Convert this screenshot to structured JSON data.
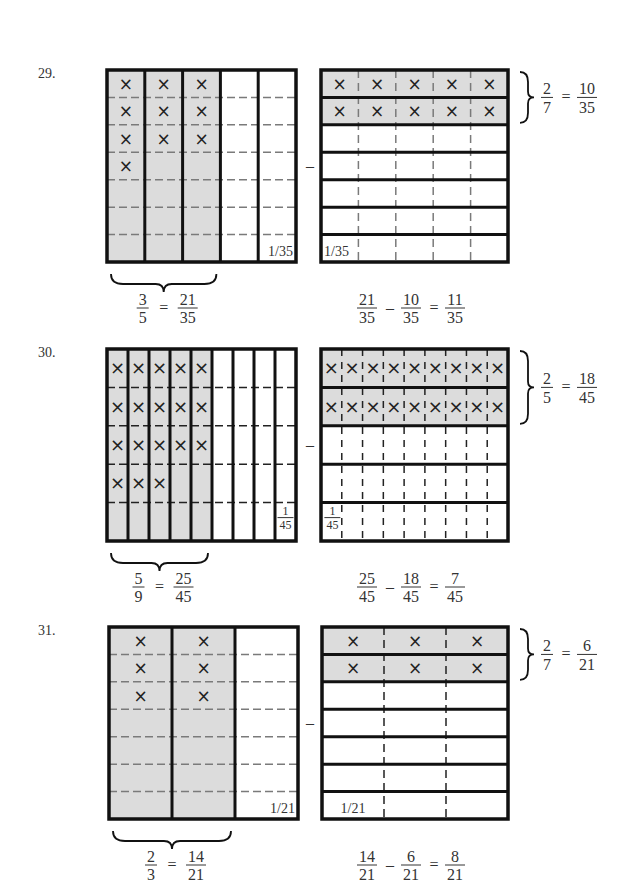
{
  "problems": [
    {
      "number": "29.",
      "top": 70,
      "bottom": 262,
      "left_grid": {
        "x": 107,
        "w": 189,
        "cols": 5,
        "shaded_cols": 3,
        "rows": 7,
        "x_counts_per_col": [
          4,
          3,
          3
        ],
        "unit_label": "1/35",
        "unit_label_type": "inline"
      },
      "right_grid": {
        "x": 321,
        "w": 187,
        "rows": 7,
        "shaded_rows": 2,
        "cols": 5,
        "unit_label": "1/35",
        "unit_label_type": "inline"
      },
      "minus": "–",
      "left_eq": {
        "a_num": "3",
        "a_den": "5",
        "eq": "=",
        "b_num": "21",
        "b_den": "35"
      },
      "right_brace_eq": {
        "a_num": "2",
        "a_den": "7",
        "eq": "=",
        "b_num": "10",
        "b_den": "35"
      },
      "result_eq": {
        "a_num": "21",
        "a_den": "35",
        "op": "–",
        "b_num": "10",
        "b_den": "35",
        "eq": "=",
        "c_num": "11",
        "c_den": "35"
      }
    },
    {
      "number": "30.",
      "top": 349,
      "bottom": 541,
      "left_grid": {
        "x": 107,
        "w": 189,
        "cols": 9,
        "shaded_cols": 5,
        "rows": 5,
        "x_counts_per_col": [
          4,
          4,
          4,
          3,
          3
        ],
        "unit_label": "1/45",
        "unit_label_type": "stacked"
      },
      "right_grid": {
        "x": 321,
        "w": 187,
        "rows": 5,
        "shaded_rows": 2,
        "cols": 9,
        "unit_label": "1/45",
        "unit_label_type": "stacked"
      },
      "minus": "–",
      "left_eq": {
        "a_num": "5",
        "a_den": "9",
        "eq": "=",
        "b_num": "25",
        "b_den": "45"
      },
      "right_brace_eq": {
        "a_num": "2",
        "a_den": "5",
        "eq": "=",
        "b_num": "18",
        "b_den": "45"
      },
      "result_eq": {
        "a_num": "25",
        "a_den": "45",
        "op": "–",
        "b_num": "18",
        "b_den": "45",
        "eq": "=",
        "c_num": "7",
        "c_den": "45"
      }
    },
    {
      "number": "31.",
      "top": 627,
      "bottom": 819,
      "left_grid": {
        "x": 109,
        "w": 189,
        "cols": 3,
        "shaded_cols": 2,
        "rows": 7,
        "x_counts_per_col": [
          3,
          3
        ],
        "unit_label": "1/21",
        "unit_label_type": "inline"
      },
      "right_grid": {
        "x": 322,
        "w": 186,
        "rows": 7,
        "shaded_rows": 2,
        "cols": 3,
        "unit_label": "1/21",
        "unit_label_type": "inline"
      },
      "minus": "–",
      "left_eq": {
        "a_num": "2",
        "a_den": "3",
        "eq": "=",
        "b_num": "14",
        "b_den": "21"
      },
      "right_brace_eq": {
        "a_num": "2",
        "a_den": "7",
        "eq": "=",
        "b_num": "6",
        "b_den": "21"
      },
      "result_eq": {
        "a_num": "14",
        "a_den": "21",
        "op": "–",
        "b_num": "6",
        "b_den": "21",
        "eq": "=",
        "c_num": "8",
        "c_den": "21"
      }
    }
  ],
  "colors": {
    "shade": "#dcdcdc",
    "border": "#111111",
    "dash": "#7a7a7a",
    "dash_dark": "#222222",
    "text": "#333333"
  },
  "mark_glyph": "×"
}
